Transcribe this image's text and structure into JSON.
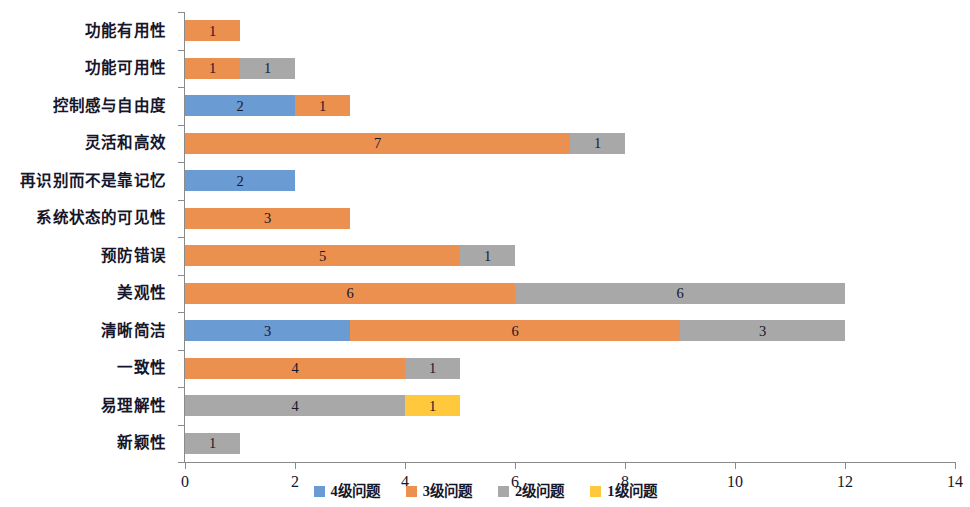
{
  "chart_data": {
    "type": "bar",
    "orientation": "horizontal",
    "stacked": true,
    "title": "",
    "xlabel": "",
    "ylabel": "",
    "xlim": [
      0,
      14
    ],
    "xticks": [
      0,
      2,
      4,
      6,
      8,
      10,
      12,
      14
    ],
    "grid": false,
    "legend_position": "bottom",
    "categories": [
      "功能有用性",
      "功能可用性",
      "控制感与自由度",
      "灵活和高效",
      "再识别而不是靠记忆",
      "系统状态的可见性",
      "预防错误",
      "美观性",
      "清晰简洁",
      "一致性",
      "易理解性",
      "新颖性"
    ],
    "series": [
      {
        "name": "4级问题",
        "color": "#6a9bd3",
        "values": [
          0,
          0,
          2,
          0,
          2,
          0,
          0,
          0,
          3,
          0,
          0,
          0
        ]
      },
      {
        "name": "3级问题",
        "color": "#ec9050",
        "values": [
          1,
          1,
          1,
          7,
          0,
          3,
          5,
          6,
          6,
          4,
          0,
          0
        ]
      },
      {
        "name": "2级问题",
        "color": "#a8a8a8",
        "values": [
          0,
          1,
          0,
          1,
          0,
          0,
          1,
          6,
          3,
          1,
          4,
          1
        ]
      },
      {
        "name": "1级问题",
        "color": "#ffc83d",
        "values": [
          0,
          0,
          0,
          0,
          0,
          0,
          0,
          0,
          0,
          0,
          1,
          0
        ]
      }
    ],
    "totals": [
      1,
      2,
      3,
      8,
      2,
      3,
      6,
      12,
      12,
      5,
      5,
      1
    ]
  },
  "legend": {
    "items": [
      {
        "label": "4级问题",
        "color": "#6a9bd3"
      },
      {
        "label": "3级问题",
        "color": "#ec9050"
      },
      {
        "label": "2级问题",
        "color": "#a8a8a8"
      },
      {
        "label": "1级问题",
        "color": "#ffc83d"
      }
    ]
  },
  "axis": {
    "x_tick_labels": [
      "0",
      "2",
      "4",
      "6",
      "8",
      "10",
      "12",
      "14"
    ]
  }
}
